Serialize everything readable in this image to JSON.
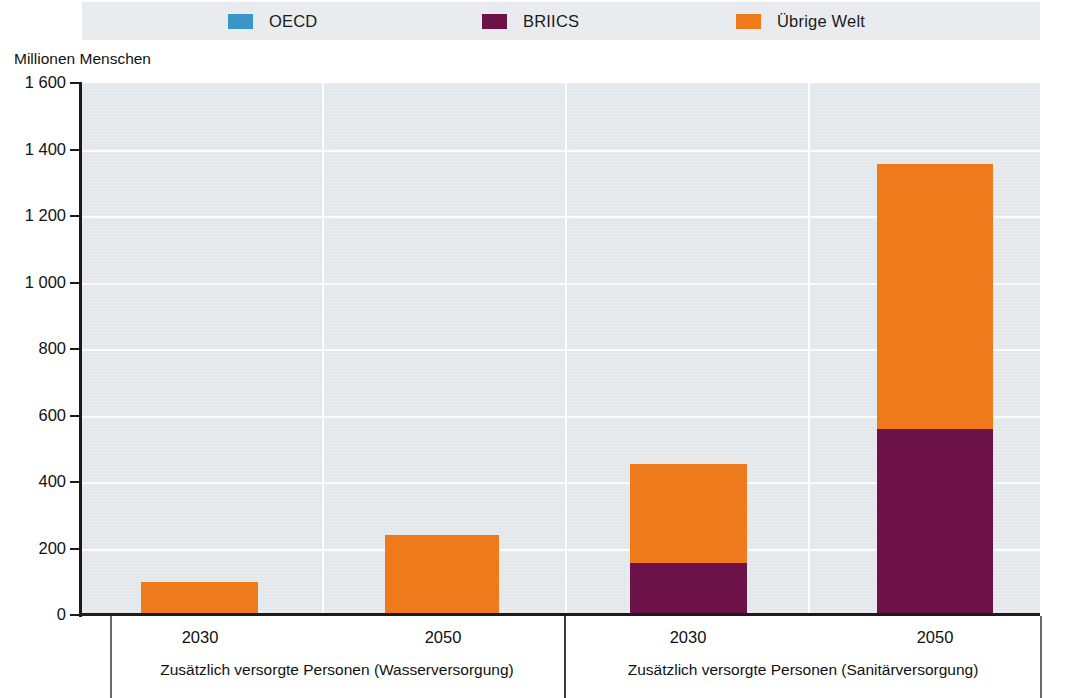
{
  "legend": {
    "items": [
      {
        "label": "OECD",
        "color": "#3a96c6",
        "icon": "legend-swatch-oecd"
      },
      {
        "label": "BRIICS",
        "color": "#6d1149",
        "icon": "legend-swatch-briics"
      },
      {
        "label": "Übrige Welt",
        "color": "#ef7a1c",
        "icon": "legend-swatch-uebrige-welt"
      }
    ],
    "band_color": "#e9ecee"
  },
  "axis": {
    "y_title": "Millionen Menschen",
    "y_ticks": [
      "1 600",
      "1 400",
      "1 200",
      "1 000",
      "800",
      "600",
      "400",
      "200",
      "0"
    ],
    "y_min": 0,
    "y_max": 1600,
    "y_step": 200
  },
  "panels": [
    {
      "caption": "Zusätzlich versorgte Personen (Wasserversorgung)",
      "groups": [
        "2030",
        "2050"
      ]
    },
    {
      "caption": "Zusätzlich versorgte Personen (Sanitärversorgung)",
      "groups": [
        "2030",
        "2050"
      ]
    }
  ],
  "chart_data": {
    "type": "bar",
    "title": "",
    "subtitle": "",
    "xlabel": "",
    "ylabel": "Millionen Menschen",
    "ylim": [
      0,
      1600
    ],
    "ytick_values": [
      0,
      200,
      400,
      600,
      800,
      1000,
      1200,
      1400,
      1600
    ],
    "ytick_labels": [
      "0",
      "200",
      "400",
      "600",
      "800",
      "1 000",
      "1 200",
      "1 400",
      "1 600"
    ],
    "grid": true,
    "stacked": true,
    "legend_position": "top",
    "panels": [
      "Zusätzlich versorgte Personen (Wasserversorgung)",
      "Zusätzlich versorgte Personen (Sanitärversorgung)"
    ],
    "categories": [
      "Wasserversorgung 2030",
      "Wasserversorgung 2050",
      "Sanitärversorgung 2030",
      "Sanitärversorgung 2050"
    ],
    "series": [
      {
        "name": "OECD",
        "color": "#3a96c6",
        "values": [
          0,
          0,
          0,
          0
        ]
      },
      {
        "name": "BRIICS",
        "color": "#6d1149",
        "values": [
          0,
          0,
          155,
          560
        ]
      },
      {
        "name": "Übrige Welt",
        "color": "#ef7a1c",
        "values": [
          100,
          240,
          300,
          795
        ]
      }
    ],
    "totals": [
      100,
      240,
      455,
      1355
    ],
    "units": "Millionen Menschen"
  },
  "bars": [
    {
      "name": "bar-wasser-2030",
      "left": 59,
      "width": 117,
      "segments": [
        {
          "series": "Übrige Welt",
          "color": "#ef7a1c",
          "value": 100
        }
      ]
    },
    {
      "name": "bar-wasser-2050",
      "left": 303,
      "width": 114,
      "segments": [
        {
          "series": "Übrige Welt",
          "color": "#ef7a1c",
          "value": 240
        }
      ]
    },
    {
      "name": "bar-sanitaer-2030",
      "left": 548,
      "width": 117,
      "segments": [
        {
          "series": "BRIICS",
          "color": "#6d1149",
          "value": 155
        },
        {
          "series": "Übrige Welt",
          "color": "#ef7a1c",
          "value": 300
        }
      ]
    },
    {
      "name": "bar-sanitaer-2050",
      "left": 795,
      "width": 116,
      "segments": [
        {
          "series": "BRIICS",
          "color": "#6d1149",
          "value": 560
        },
        {
          "series": "Übrige Welt",
          "color": "#ef7a1c",
          "value": 795
        }
      ]
    }
  ],
  "group_labels": [
    {
      "text": "2030",
      "center": 200
    },
    {
      "text": "2050",
      "center": 443
    },
    {
      "text": "2030",
      "center": 688
    },
    {
      "text": "2050",
      "center": 935
    }
  ]
}
